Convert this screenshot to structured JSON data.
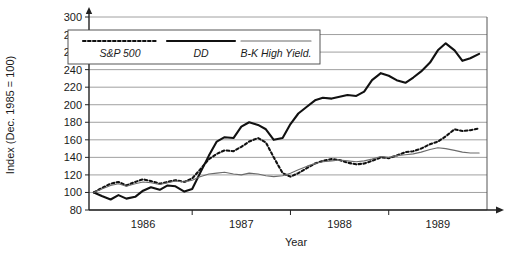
{
  "chart_data": {
    "type": "line",
    "title": "",
    "subtitle": "",
    "xlabel": "Year",
    "ylabel": "Index (Dec. 1985 = 100)",
    "xlim": [
      1985.95,
      1990.0
    ],
    "ylim": [
      80,
      300
    ],
    "ytick_step": 20,
    "yticks": [
      80,
      100,
      120,
      140,
      160,
      180,
      200,
      220,
      240,
      260,
      280,
      300
    ],
    "xticks": [
      1986,
      1987,
      1988,
      1989
    ],
    "xtick_labels": [
      "1986",
      "1987",
      "1988",
      "1989"
    ],
    "grid": "horizontal",
    "legend_position": "top-left-inside",
    "axis_arrows": [
      "x-right",
      "y-up"
    ],
    "series": [
      {
        "name": "S&P 500",
        "style": "dotted",
        "color": "#111111",
        "x": [
          1986.0,
          1986.08,
          1986.17,
          1986.25,
          1986.33,
          1986.42,
          1986.5,
          1986.58,
          1986.67,
          1986.75,
          1986.83,
          1986.92,
          1987.0,
          1987.08,
          1987.17,
          1987.25,
          1987.33,
          1987.42,
          1987.5,
          1987.58,
          1987.67,
          1987.75,
          1987.83,
          1987.92,
          1988.0,
          1988.08,
          1988.17,
          1988.25,
          1988.33,
          1988.42,
          1988.5,
          1988.58,
          1988.67,
          1988.75,
          1988.83,
          1988.92,
          1989.0,
          1989.08,
          1989.17,
          1989.25,
          1989.33,
          1989.42,
          1989.5,
          1989.58,
          1989.67,
          1989.75,
          1989.83,
          1989.92
        ],
        "y": [
          100,
          105,
          110,
          112,
          108,
          112,
          115,
          113,
          110,
          112,
          114,
          112,
          116,
          126,
          138,
          144,
          148,
          147,
          152,
          158,
          162,
          157,
          140,
          122,
          118,
          122,
          128,
          133,
          136,
          138,
          137,
          134,
          132,
          133,
          136,
          140,
          139,
          142,
          146,
          147,
          150,
          155,
          158,
          164,
          172,
          170,
          171,
          173
        ]
      },
      {
        "name": "DD",
        "style": "solid-thick",
        "color": "#111111",
        "x": [
          1986.0,
          1986.08,
          1986.17,
          1986.25,
          1986.33,
          1986.42,
          1986.5,
          1986.58,
          1986.67,
          1986.75,
          1986.83,
          1986.92,
          1987.0,
          1987.08,
          1987.17,
          1987.25,
          1987.33,
          1987.42,
          1987.5,
          1987.58,
          1987.67,
          1987.75,
          1987.83,
          1987.92,
          1988.0,
          1988.08,
          1988.17,
          1988.25,
          1988.33,
          1988.42,
          1988.5,
          1988.58,
          1988.67,
          1988.75,
          1988.83,
          1988.92,
          1989.0,
          1989.08,
          1989.17,
          1989.25,
          1989.33,
          1989.42,
          1989.5,
          1989.58,
          1989.67,
          1989.75,
          1989.83,
          1989.92
        ],
        "y": [
          100,
          96,
          92,
          97,
          93,
          95,
          102,
          106,
          103,
          108,
          107,
          101,
          104,
          122,
          142,
          158,
          163,
          162,
          175,
          180,
          177,
          172,
          160,
          162,
          178,
          190,
          198,
          205,
          208,
          207,
          209,
          211,
          210,
          215,
          228,
          236,
          233,
          228,
          225,
          231,
          238,
          248,
          262,
          270,
          262,
          250,
          253,
          258
        ]
      },
      {
        "name": "B-K High Yield.",
        "style": "solid-thin",
        "color": "#6b6b6b",
        "x": [
          1986.0,
          1986.08,
          1986.17,
          1986.25,
          1986.33,
          1986.42,
          1986.5,
          1986.58,
          1986.67,
          1986.75,
          1986.83,
          1986.92,
          1987.0,
          1987.08,
          1987.17,
          1987.25,
          1987.33,
          1987.42,
          1987.5,
          1987.58,
          1987.67,
          1987.75,
          1987.83,
          1987.92,
          1988.0,
          1988.08,
          1988.17,
          1988.25,
          1988.33,
          1988.42,
          1988.5,
          1988.58,
          1988.67,
          1988.75,
          1988.83,
          1988.92,
          1989.0,
          1989.08,
          1989.17,
          1989.25,
          1989.33,
          1989.42,
          1989.5,
          1989.58,
          1989.67,
          1989.75,
          1989.83,
          1989.92
        ],
        "y": [
          100,
          104,
          108,
          110,
          107,
          110,
          112,
          111,
          109,
          111,
          113,
          112,
          114,
          118,
          121,
          122,
          123,
          121,
          120,
          122,
          121,
          119,
          118,
          119,
          122,
          126,
          130,
          133,
          135,
          136,
          137,
          136,
          135,
          136,
          138,
          141,
          140,
          142,
          143,
          144,
          146,
          149,
          151,
          150,
          148,
          146,
          145,
          145
        ]
      }
    ]
  },
  "legend": {
    "items": [
      {
        "label": "S&P 500",
        "style": "dotted"
      },
      {
        "label": "DD",
        "style": "solid-thick"
      },
      {
        "label": "B-K High Yield.",
        "style": "solid-thin"
      }
    ]
  },
  "axes": {
    "y_title": "Index (Dec. 1985 = 100)",
    "x_title": "Year",
    "y_tick_labels": [
      "300",
      "280",
      "260",
      "240",
      "220",
      "200",
      "180",
      "160",
      "140",
      "120",
      "100",
      "80"
    ],
    "x_tick_labels": [
      "1986",
      "1987",
      "1988",
      "1989"
    ]
  },
  "colors": {
    "grid": "#888888",
    "frame": "#555555",
    "axis": "#222222",
    "series_primary": "#111111",
    "series_secondary": "#6b6b6b",
    "background": "#ffffff"
  }
}
